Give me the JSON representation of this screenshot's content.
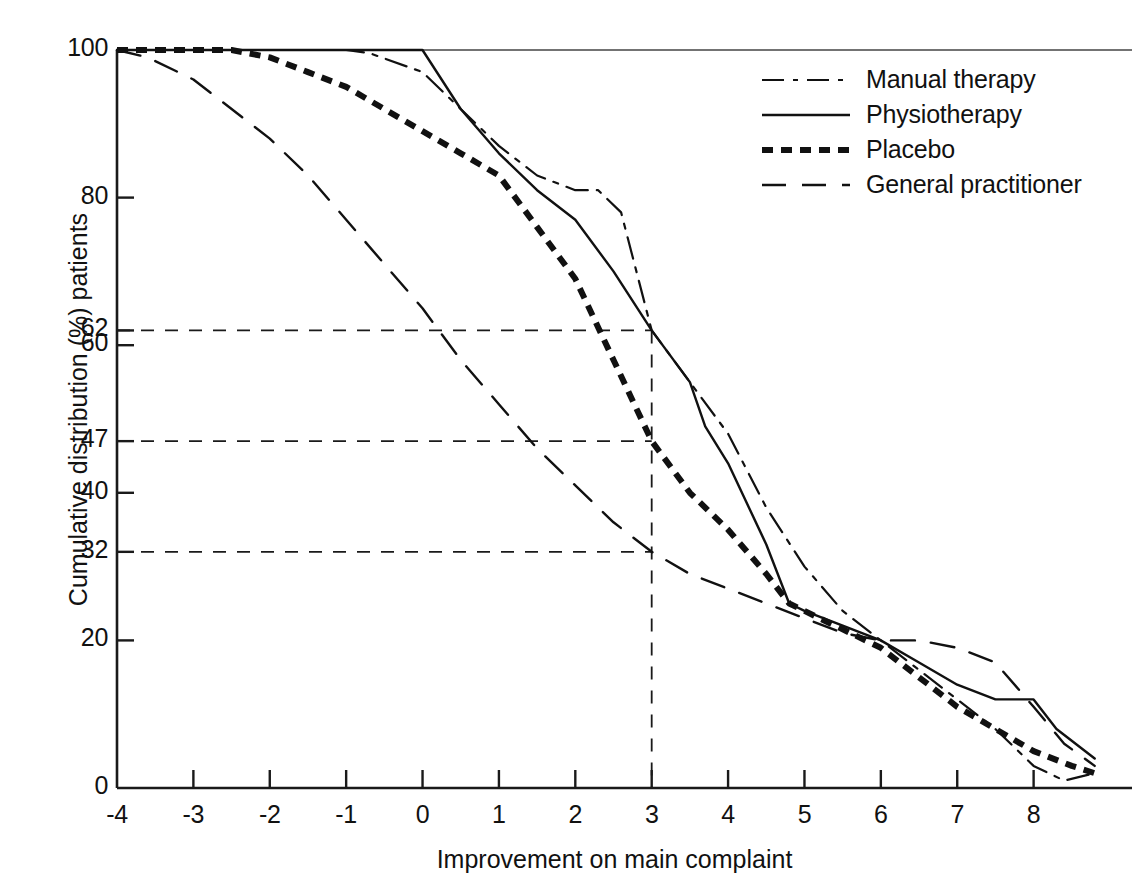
{
  "chart_data": {
    "type": "line",
    "title": "",
    "xlabel": "Improvement on main complaint",
    "ylabel": "Cumulative distribution (%) patients",
    "xlim": [
      -4,
      9
    ],
    "ylim": [
      0,
      100
    ],
    "grid": false,
    "legend_position": "top-right",
    "xticks": [
      "-4",
      "-3",
      "-2",
      "-1",
      "0",
      "1",
      "2",
      "3",
      "4",
      "5",
      "6",
      "7",
      "8"
    ],
    "xtick_values": [
      -4,
      -3,
      -2,
      -1,
      0,
      1,
      2,
      3,
      4,
      5,
      6,
      7,
      8
    ],
    "yticks": [
      "0",
      "20",
      "32",
      "40",
      "47",
      "60",
      "62",
      "80",
      "100"
    ],
    "ytick_values": [
      0,
      20,
      32,
      40,
      47,
      60,
      62,
      80,
      100
    ],
    "reference_lines": {
      "vertical_x": 3,
      "horizontal_y": [
        62,
        47,
        32
      ],
      "note": "Dashed guides from y-axis to x = 3"
    },
    "series": [
      {
        "name": "Manual therapy",
        "style": "dash-dot",
        "color": "#111111",
        "width": 2.2,
        "points": [
          [
            -4,
            100
          ],
          [
            -2,
            100
          ],
          [
            -1,
            100
          ],
          [
            -0.7,
            99.6
          ],
          [
            0,
            97
          ],
          [
            0.5,
            92
          ],
          [
            1,
            87
          ],
          [
            1.5,
            83
          ],
          [
            2,
            81
          ],
          [
            2.3,
            81
          ],
          [
            2.6,
            78
          ],
          [
            3,
            62
          ],
          [
            3.5,
            55
          ],
          [
            4,
            48
          ],
          [
            4.5,
            38
          ],
          [
            5,
            30
          ],
          [
            5.5,
            24
          ],
          [
            6,
            20
          ],
          [
            6.5,
            16
          ],
          [
            7,
            12
          ],
          [
            7.5,
            8
          ],
          [
            8,
            3
          ],
          [
            8.4,
            1
          ],
          [
            8.8,
            2
          ]
        ]
      },
      {
        "name": "Physiotherapy",
        "style": "solid",
        "color": "#111111",
        "width": 2.4,
        "points": [
          [
            -4,
            100
          ],
          [
            -1,
            100
          ],
          [
            0,
            100
          ],
          [
            0.5,
            92
          ],
          [
            1,
            86
          ],
          [
            1.5,
            81
          ],
          [
            2,
            77
          ],
          [
            2.5,
            70
          ],
          [
            3,
            62
          ],
          [
            3.5,
            55
          ],
          [
            3.7,
            49
          ],
          [
            4,
            44
          ],
          [
            4.5,
            33
          ],
          [
            4.8,
            25
          ],
          [
            5,
            24
          ],
          [
            5.5,
            22
          ],
          [
            6,
            20
          ],
          [
            6.5,
            17
          ],
          [
            7,
            14
          ],
          [
            7.5,
            12
          ],
          [
            7.8,
            12
          ],
          [
            8,
            12
          ],
          [
            8.3,
            8
          ],
          [
            8.8,
            4
          ]
        ]
      },
      {
        "name": "Placebo",
        "style": "thick-dotted",
        "color": "#111111",
        "width": 6,
        "points": [
          [
            -4,
            100
          ],
          [
            -2.5,
            100
          ],
          [
            -2,
            99
          ],
          [
            -1.5,
            97
          ],
          [
            -1,
            95
          ],
          [
            -0.5,
            92
          ],
          [
            0,
            89
          ],
          [
            0.5,
            86
          ],
          [
            1,
            83
          ],
          [
            1.5,
            76
          ],
          [
            2,
            69
          ],
          [
            2.5,
            58
          ],
          [
            3,
            47
          ],
          [
            3.5,
            40
          ],
          [
            4,
            35
          ],
          [
            4.5,
            29
          ],
          [
            4.8,
            25
          ],
          [
            5.2,
            23
          ],
          [
            5.6,
            21
          ],
          [
            6,
            19
          ],
          [
            6.5,
            15
          ],
          [
            7,
            11
          ],
          [
            7.5,
            8
          ],
          [
            8,
            5
          ],
          [
            8.5,
            3
          ],
          [
            8.8,
            2
          ]
        ]
      },
      {
        "name": "General practitioner",
        "style": "long-dash",
        "color": "#111111",
        "width": 2.4,
        "points": [
          [
            -4,
            100
          ],
          [
            -3.6,
            99
          ],
          [
            -3,
            96
          ],
          [
            -2.5,
            92
          ],
          [
            -2,
            88
          ],
          [
            -1.5,
            83
          ],
          [
            -1,
            77
          ],
          [
            -0.5,
            71
          ],
          [
            0,
            65
          ],
          [
            0.5,
            58
          ],
          [
            1,
            52
          ],
          [
            1.5,
            46
          ],
          [
            2,
            41
          ],
          [
            2.5,
            36
          ],
          [
            3,
            32
          ],
          [
            3.5,
            29
          ],
          [
            4,
            27
          ],
          [
            4.5,
            25
          ],
          [
            5,
            23
          ],
          [
            5.5,
            21
          ],
          [
            6,
            20
          ],
          [
            6.5,
            20
          ],
          [
            7,
            19
          ],
          [
            7.5,
            17
          ],
          [
            8,
            11
          ],
          [
            8.4,
            6
          ],
          [
            8.8,
            3
          ]
        ]
      }
    ]
  },
  "legend": {
    "items": [
      {
        "label": "Manual therapy",
        "style": "dash-dot"
      },
      {
        "label": "Physiotherapy",
        "style": "solid"
      },
      {
        "label": "Placebo",
        "style": "thick-dotted"
      },
      {
        "label": "General practitioner",
        "style": "long-dash"
      }
    ]
  },
  "axes": {
    "x_title": "Improvement on main complaint",
    "y_title": "Cumulative distribution (%) patients"
  }
}
